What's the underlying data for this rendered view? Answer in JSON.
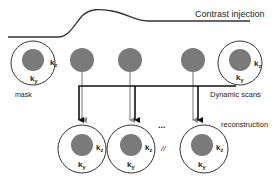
{
  "labels": {
    "contrast_injection": "Contrast injection",
    "mask": "mask",
    "dynamic_scans": "Dynamic scans",
    "reconstruction": "reconstruction",
    "ellipsis": "...",
    "separator": "//"
  },
  "axes": {
    "kz_base": "k",
    "kz_sub": "z",
    "ky_base": "k",
    "ky_sub": "y"
  },
  "colors": {
    "filled_circle": "#7a7a7a",
    "outline": "#333333",
    "thin_line": "#8a8a8a",
    "thick_line": "#111111"
  }
}
